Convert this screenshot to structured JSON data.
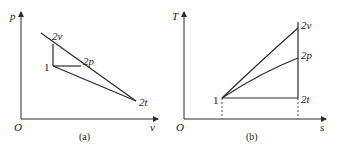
{
  "panels": [
    {
      "id": "a",
      "caption": "(a)",
      "axes": {
        "y_label": "p",
        "x_label": "v",
        "origin_label": "O"
      },
      "points": {
        "p1": {
          "label": "1"
        },
        "p2v": {
          "label": "2v"
        },
        "p2p": {
          "label": "2p"
        },
        "p2t": {
          "label": "2t"
        }
      }
    },
    {
      "id": "b",
      "caption": "(b)",
      "axes": {
        "y_label": "T",
        "x_label": "s",
        "origin_label": "O"
      },
      "points": {
        "p1": {
          "label": "1"
        },
        "p2v": {
          "label": "2v"
        },
        "p2p": {
          "label": "2p"
        },
        "p2t": {
          "label": "2t"
        }
      }
    }
  ],
  "colors": {
    "line": "#2a2a2a",
    "text": "#222222",
    "background": "#ffffff"
  }
}
